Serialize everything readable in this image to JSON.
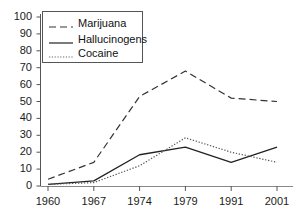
{
  "chart_data": {
    "type": "line",
    "title": "",
    "subtitle": "",
    "xlabel": "",
    "ylabel": "",
    "categories": [
      "1960",
      "1967",
      "1974",
      "1979",
      "1991",
      "2001"
    ],
    "x": [
      1960,
      1967,
      1974,
      1979,
      1991,
      2001
    ],
    "series": [
      {
        "name": "Marijuana",
        "style": "dashed",
        "color": "#333333",
        "values": [
          4,
          14,
          53,
          68,
          52,
          50
        ]
      },
      {
        "name": "Hallucinogens",
        "style": "solid",
        "color": "#222222",
        "values": [
          1,
          3,
          18.5,
          23,
          14,
          23
        ]
      },
      {
        "name": "Cocaine",
        "style": "dotted",
        "color": "#555555",
        "values": [
          1,
          2,
          12,
          28.5,
          20,
          14
        ]
      }
    ],
    "ylim": [
      0,
      100
    ],
    "y_ticks": [
      0,
      10,
      20,
      30,
      40,
      50,
      60,
      70,
      80,
      90,
      100
    ],
    "y_tick_labels": [
      "0",
      "10",
      "20",
      "30",
      "40",
      "50",
      "60",
      "70",
      "80",
      "90",
      "100"
    ],
    "x_tick_labels": [
      "1960",
      "1967",
      "1974",
      "1979",
      "1991",
      "2001"
    ],
    "grid": false,
    "legend_position": "upper-left",
    "legend_entries": [
      "Marijuana",
      "Hallucinogens",
      "Cocaine"
    ]
  },
  "axes": {
    "y_axis_name": "y-axis",
    "x_axis_name": "x-axis"
  }
}
